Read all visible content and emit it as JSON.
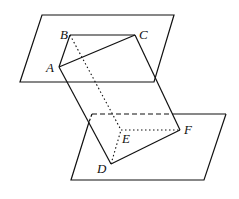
{
  "diagram": {
    "colors": {
      "line": "#111111",
      "background": "#ffffff"
    },
    "labels": {
      "A": "A",
      "B": "B",
      "C": "C",
      "D": "D",
      "E": "E",
      "F": "F"
    },
    "points": {
      "A": [
        59,
        67
      ],
      "B": [
        70,
        35
      ],
      "C": [
        135,
        35
      ],
      "D": [
        111,
        164
      ],
      "E": [
        121,
        130
      ],
      "F": [
        180,
        130
      ]
    },
    "planes": {
      "upper": [
        [
          42,
          15
        ],
        [
          174,
          15
        ],
        [
          154,
          82
        ],
        [
          20,
          82
        ]
      ],
      "lower": [
        [
          92,
          114
        ],
        [
          226,
          114
        ],
        [
          204,
          180
        ],
        [
          71,
          180
        ]
      ]
    },
    "edges": {
      "solid": [
        "AB",
        "BC",
        "CA",
        "DF",
        "AD",
        "CF"
      ],
      "dotted": [
        "BE",
        "DE",
        "EF"
      ],
      "dashed": [
        "lower plane hidden top edge"
      ]
    }
  }
}
